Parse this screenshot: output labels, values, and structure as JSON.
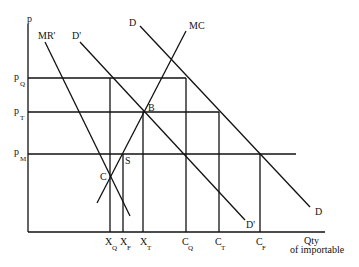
{
  "diagram": {
    "axes": {
      "y_label": "p",
      "x_label_line1": "Qty",
      "x_label_line2": "of importable"
    },
    "price_levels": [
      {
        "main": "p",
        "sub": "Q"
      },
      {
        "main": "p",
        "sub": "T"
      },
      {
        "main": "p",
        "sub": "M"
      }
    ],
    "quantities": [
      {
        "main": "X",
        "sub": "Q"
      },
      {
        "main": "X",
        "sub": "F"
      },
      {
        "main": "X",
        "sub": "T"
      },
      {
        "main": "C",
        "sub": "Q"
      },
      {
        "main": "C",
        "sub": "T"
      },
      {
        "main": "C",
        "sub": "F"
      }
    ],
    "curves": {
      "mr_prime": "MR'",
      "d_prime_top": "D'",
      "d_prime_bottom": "D'",
      "d_top": "D",
      "d_bottom": "D",
      "mc": "MC"
    },
    "points": {
      "b": "B",
      "c": "C",
      "s": "S"
    }
  }
}
